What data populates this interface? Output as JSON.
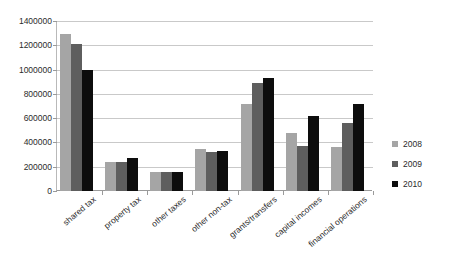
{
  "chart_data": {
    "type": "bar",
    "title": "",
    "subtitle": "",
    "xlabel": "",
    "ylabel": "",
    "ylim": [
      0,
      1400000
    ],
    "ytick_step": 200000,
    "grid": true,
    "legend_position": "right",
    "categories": [
      "shared tax",
      "property tax",
      "other taxes",
      "other non-tax",
      "grants/transfers",
      "capital incomes",
      "financial operations"
    ],
    "ytick_labels": [
      "1400000",
      "1200000",
      "1000000",
      "800000",
      "600000",
      "400000",
      "200000",
      "0"
    ],
    "ytick_values": [
      1400000,
      1200000,
      1000000,
      800000,
      600000,
      400000,
      200000,
      0
    ],
    "series": [
      {
        "name": "2008",
        "color": "#a5a5a5",
        "values": [
          1290000,
          235000,
          160000,
          350000,
          720000,
          480000,
          365000
        ]
      },
      {
        "name": "2009",
        "color": "#5e5e5e",
        "values": [
          1210000,
          240000,
          160000,
          320000,
          890000,
          370000,
          560000
        ]
      },
      {
        "name": "2010",
        "color": "#0d0d0d",
        "values": [
          995000,
          270000,
          160000,
          330000,
          930000,
          620000,
          715000
        ]
      }
    ]
  },
  "legend": {
    "entries": [
      {
        "label": "2008",
        "color": "#a5a5a5"
      },
      {
        "label": "2009",
        "color": "#5e5e5e"
      },
      {
        "label": "2010",
        "color": "#0d0d0d"
      }
    ]
  },
  "colors": {
    "series_2008": "#a5a5a5",
    "series_2009": "#5e5e5e",
    "series_2010": "#0d0d0d",
    "gridline": "#c9c9c9",
    "axis": "#9a9a9a",
    "text": "#2b2b2b",
    "background": "#ffffff"
  }
}
